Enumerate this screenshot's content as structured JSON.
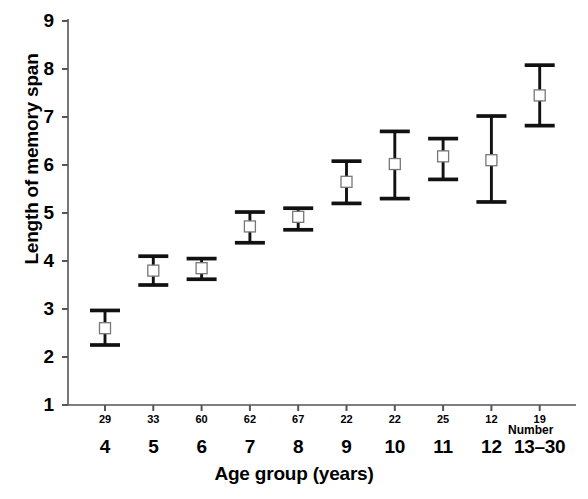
{
  "chart_data": {
    "type": "scatter",
    "title": "",
    "xlabel": "Age group (years)",
    "ylabel": "Length of memory span",
    "ylim": [
      1,
      9
    ],
    "yticks": [
      1,
      2,
      3,
      4,
      5,
      6,
      7,
      8,
      9
    ],
    "ytick_labels": [
      "1",
      "2",
      "3",
      "4",
      "5",
      "6",
      "7",
      "8",
      "9"
    ],
    "grid": false,
    "legend": null,
    "marker": "open-square",
    "error_bars": "vertical-capped",
    "secondary_axis_label": "Number",
    "categories": [
      "4",
      "5",
      "6",
      "7",
      "8",
      "9",
      "10",
      "11",
      "12",
      "13–30"
    ],
    "counts": [
      29,
      33,
      60,
      62,
      67,
      22,
      22,
      25,
      12,
      19
    ],
    "values": [
      2.6,
      3.8,
      3.85,
      4.72,
      4.92,
      5.65,
      6.02,
      6.18,
      6.1,
      7.45
    ],
    "lower": [
      2.25,
      3.5,
      3.62,
      4.38,
      4.65,
      5.2,
      5.3,
      5.7,
      5.23,
      6.82
    ],
    "upper": [
      2.97,
      4.1,
      4.05,
      5.02,
      5.1,
      6.08,
      6.7,
      6.55,
      7.02,
      8.08
    ],
    "series": [
      {
        "name": "Length of memory span",
        "points": [
          {
            "category": "4",
            "count": 29,
            "mean": 2.6,
            "lower": 2.25,
            "upper": 2.97
          },
          {
            "category": "5",
            "count": 33,
            "mean": 3.8,
            "lower": 3.5,
            "upper": 4.1
          },
          {
            "category": "6",
            "count": 60,
            "mean": 3.85,
            "lower": 3.62,
            "upper": 4.05
          },
          {
            "category": "7",
            "count": 62,
            "mean": 4.72,
            "lower": 4.38,
            "upper": 5.02
          },
          {
            "category": "8",
            "count": 67,
            "mean": 4.92,
            "lower": 4.65,
            "upper": 5.1
          },
          {
            "category": "9",
            "count": 22,
            "mean": 5.65,
            "lower": 5.2,
            "upper": 6.08
          },
          {
            "category": "10",
            "count": 22,
            "mean": 6.02,
            "lower": 5.3,
            "upper": 6.7
          },
          {
            "category": "11",
            "count": 25,
            "mean": 6.18,
            "lower": 5.7,
            "upper": 6.55
          },
          {
            "category": "12",
            "count": 12,
            "mean": 6.1,
            "lower": 5.23,
            "upper": 7.02
          },
          {
            "category": "13–30",
            "count": 19,
            "mean": 7.45,
            "lower": 6.82,
            "upper": 8.08
          }
        ]
      }
    ],
    "colors": {
      "axis": "#555555",
      "marker_stroke": "#777777",
      "marker_fill": "#ffffff",
      "error_bar": "#111111",
      "text": "#000000",
      "background": "#ffffff"
    }
  }
}
